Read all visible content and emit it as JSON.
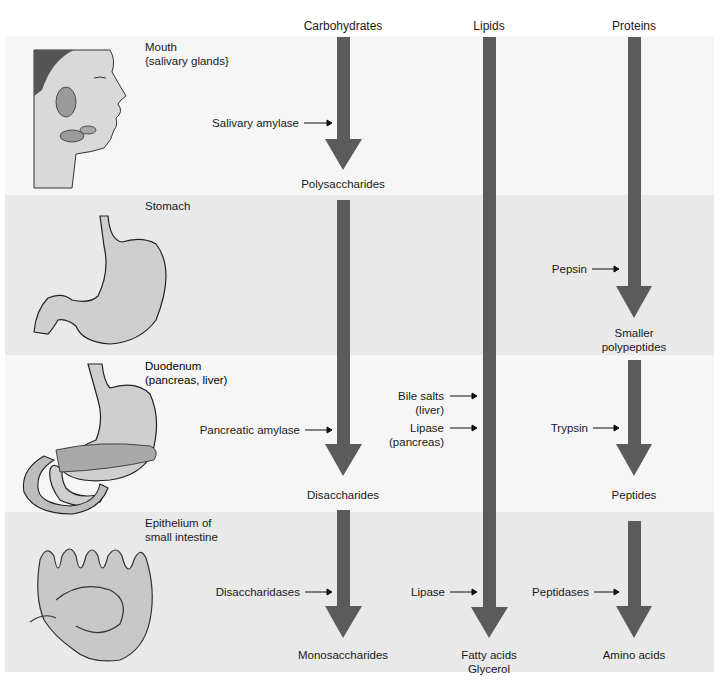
{
  "columns": [
    {
      "label": "Carbohydrates",
      "x": 343
    },
    {
      "label": "Lipids",
      "x": 489
    },
    {
      "label": "Proteins",
      "x": 634
    }
  ],
  "stages": [
    {
      "organ": "Mouth",
      "organ_sub": "{salivary glands}"
    },
    {
      "organ": "Stomach",
      "organ_sub": ""
    },
    {
      "organ": "Duodenum",
      "organ_sub": "(pancreas, liver)"
    },
    {
      "organ": "Epithelium of",
      "organ_sub": "small intestine"
    }
  ],
  "enzymes": {
    "salivary_amylase": "Salivary amylase",
    "pepsin": "Pepsin",
    "pancreatic_amylase": "Pancreatic amylase",
    "bile_salts": "Bile salts",
    "bile_salts_source": "(liver)",
    "lipase_pancreas": "Lipase",
    "lipase_pancreas_source": "(pancreas)",
    "trypsin": "Trypsin",
    "disaccharidases": "Disaccharidases",
    "lipase_intestine": "Lipase",
    "peptidases": "Peptidases"
  },
  "products": {
    "polysaccharides": "Polysaccharides",
    "smaller_polypeptides_1": "Smaller",
    "smaller_polypeptides_2": "polypeptides",
    "disaccharides": "Disaccharides",
    "peptides": "Peptides",
    "monosaccharides": "Monosaccharides",
    "fatty_acids": "Fatty acids",
    "glycerol": "Glycerol",
    "amino_acids": "Amino acids"
  },
  "colors": {
    "arrow": "#5b5b5b",
    "band_light": "#f6f6f6",
    "band_dark": "#e9e9e9"
  }
}
